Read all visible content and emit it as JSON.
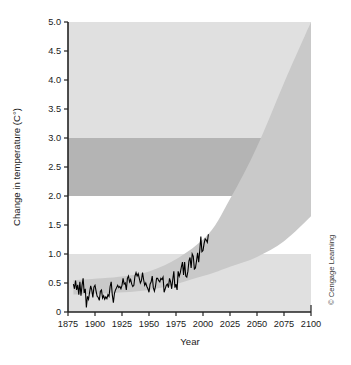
{
  "chart_data": {
    "type": "line",
    "title": "",
    "xlabel": "Year",
    "ylabel": "Change in temperature (C°)",
    "xlim": [
      1875,
      2100
    ],
    "ylim": [
      0,
      5.0
    ],
    "grid": false,
    "legend_position": "none",
    "x_ticks": [
      "1875",
      "1900",
      "1925",
      "1950",
      "1975",
      "2000",
      "2025",
      "2050",
      "2075",
      "2100"
    ],
    "x_tick_values": [
      1875,
      1900,
      1925,
      1950,
      1975,
      2000,
      2025,
      2050,
      2075,
      2100
    ],
    "y_ticks": [
      "0",
      "0.5",
      "1.0",
      "1.5",
      "2.0",
      "2.5",
      "3.0",
      "3.5",
      "4.0",
      "4.5",
      "5.0"
    ],
    "y_tick_values": [
      0,
      0.5,
      1.0,
      1.5,
      2.0,
      2.5,
      3.0,
      3.5,
      4.0,
      4.5,
      5.0
    ],
    "series": [
      {
        "name": "Observed change in temperature",
        "type": "line",
        "color": "#000000",
        "x": [
          1880,
          1881,
          1882,
          1883,
          1884,
          1885,
          1886,
          1887,
          1888,
          1889,
          1890,
          1891,
          1892,
          1893,
          1894,
          1895,
          1896,
          1897,
          1898,
          1899,
          1900,
          1901,
          1902,
          1903,
          1904,
          1905,
          1906,
          1907,
          1908,
          1909,
          1910,
          1911,
          1912,
          1913,
          1914,
          1915,
          1916,
          1917,
          1918,
          1919,
          1920,
          1921,
          1922,
          1923,
          1924,
          1925,
          1926,
          1927,
          1928,
          1929,
          1930,
          1931,
          1932,
          1933,
          1934,
          1935,
          1936,
          1937,
          1938,
          1939,
          1940,
          1941,
          1942,
          1943,
          1944,
          1945,
          1946,
          1947,
          1948,
          1949,
          1950,
          1951,
          1952,
          1953,
          1954,
          1955,
          1956,
          1957,
          1958,
          1959,
          1960,
          1961,
          1962,
          1963,
          1964,
          1965,
          1966,
          1967,
          1968,
          1969,
          1970,
          1971,
          1972,
          1973,
          1974,
          1975,
          1976,
          1977,
          1978,
          1979,
          1980,
          1981,
          1982,
          1983,
          1984,
          1985,
          1986,
          1987,
          1988,
          1989,
          1990,
          1991,
          1992,
          1993,
          1994,
          1995,
          1996,
          1997,
          1998,
          1999,
          2000,
          2001,
          2002,
          2003,
          2004,
          2005
        ],
        "values": [
          0.48,
          0.4,
          0.54,
          0.38,
          0.47,
          0.3,
          0.52,
          0.28,
          0.46,
          0.58,
          0.33,
          0.4,
          0.08,
          0.27,
          0.22,
          0.34,
          0.45,
          0.38,
          0.25,
          0.43,
          0.46,
          0.36,
          0.27,
          0.25,
          0.2,
          0.36,
          0.38,
          0.24,
          0.28,
          0.22,
          0.26,
          0.23,
          0.3,
          0.27,
          0.44,
          0.52,
          0.3,
          0.16,
          0.32,
          0.38,
          0.42,
          0.46,
          0.42,
          0.44,
          0.4,
          0.46,
          0.58,
          0.48,
          0.5,
          0.38,
          0.58,
          0.62,
          0.52,
          0.56,
          0.48,
          0.44,
          0.46,
          0.62,
          0.68,
          0.62,
          0.66,
          0.58,
          0.5,
          0.54,
          0.68,
          0.56,
          0.46,
          0.5,
          0.44,
          0.4,
          0.34,
          0.48,
          0.52,
          0.62,
          0.42,
          0.36,
          0.44,
          0.58,
          0.58,
          0.54,
          0.52,
          0.58,
          0.56,
          0.6,
          0.34,
          0.4,
          0.46,
          0.48,
          0.42,
          0.58,
          0.52,
          0.4,
          0.56,
          0.7,
          0.42,
          0.48,
          0.38,
          0.7,
          0.62,
          0.68,
          0.78,
          0.86,
          0.64,
          0.86,
          0.62,
          0.6,
          0.7,
          0.88,
          0.94,
          0.76,
          1.0,
          0.96,
          0.74,
          0.76,
          0.88,
          1.02,
          0.86,
          1.06,
          1.3,
          1.04,
          1.06,
          1.18,
          1.26,
          1.24,
          1.2,
          1.34
        ],
        "line_width": 1.1
      }
    ],
    "bands": [
      {
        "name": "background-range",
        "color": "#e0e0e0",
        "y_from": 0,
        "y_to": 5.0,
        "note": "overall light grey plot backdrop"
      },
      {
        "name": "white-band",
        "color": "#ffffff",
        "y_from": 1.0,
        "y_to": 2.0
      },
      {
        "name": "dark-band",
        "color": "#b4b4b4",
        "y_from": 2.0,
        "y_to": 3.0
      }
    ],
    "projection_cone": {
      "name": "projected warming range",
      "color": "#c9c9c9",
      "start_year": 1880,
      "upper_bound": [
        {
          "year": 1880,
          "value": 0.55
        },
        {
          "year": 1950,
          "value": 0.7
        },
        {
          "year": 2000,
          "value": 1.25
        },
        {
          "year": 2025,
          "value": 1.95
        },
        {
          "year": 2050,
          "value": 2.85
        },
        {
          "year": 2075,
          "value": 3.95
        },
        {
          "year": 2100,
          "value": 5.0
        }
      ],
      "lower_bound": [
        {
          "year": 1880,
          "value": 0.3
        },
        {
          "year": 1950,
          "value": 0.38
        },
        {
          "year": 2000,
          "value": 0.62
        },
        {
          "year": 2025,
          "value": 0.78
        },
        {
          "year": 2050,
          "value": 0.95
        },
        {
          "year": 2075,
          "value": 1.22
        },
        {
          "year": 2100,
          "value": 1.65
        }
      ]
    },
    "annotations": [
      {
        "name": "credit",
        "text": "© Cengage Learning",
        "position": "right-margin",
        "orientation": "vertical"
      }
    ]
  },
  "axes": {
    "y_label": "Change in temperature (C°)",
    "x_label": "Year"
  },
  "credit": {
    "text": "© Cengage Learning"
  }
}
